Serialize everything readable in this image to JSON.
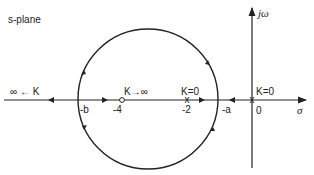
{
  "diagram": {
    "title": "s-plane",
    "axes": {
      "real_label": "σ",
      "imag_label": "jω",
      "origin_label": "0"
    },
    "points": [
      {
        "name": "pole-0",
        "label": "0",
        "value": 0,
        "marker": "x",
        "annotation": "K=0"
      },
      {
        "name": "pole-minus2",
        "label": "-2",
        "value": -2,
        "marker": "x",
        "annotation": "K=0"
      },
      {
        "name": "zero-minus4",
        "label": "-4",
        "value": -4,
        "marker": "o",
        "annotation": "K→∞"
      },
      {
        "name": "breakaway-a",
        "label": "-a",
        "marker": "none"
      },
      {
        "name": "breakin-b",
        "label": "-b",
        "marker": "none"
      }
    ],
    "annotations": {
      "left_infinity": "∞ ← K",
      "zero_annotation": "K→∞",
      "pole2_annotation": "K=0",
      "pole0_annotation": "K=0"
    },
    "stroke_color": "#222222",
    "background": "#ffffff"
  }
}
